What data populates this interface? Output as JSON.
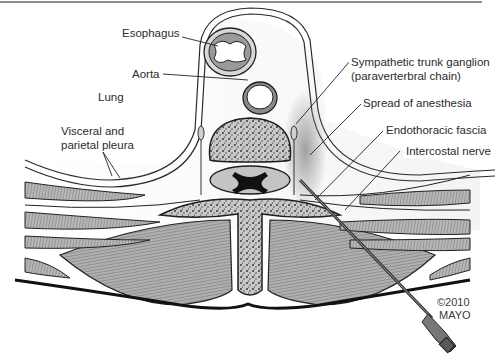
{
  "figure": {
    "labels": {
      "esophagus": "Esophagus",
      "aorta": "Aorta",
      "lung": "Lung",
      "pleura_line1": "Visceral and",
      "pleura_line2": "parietal pleura",
      "ganglion_line1": "Sympathetic trunk ganglion",
      "ganglion_line2": "(paraverterbral chain)",
      "spread": "Spread of anesthesia",
      "fascia": "Endothoracic fascia",
      "nerve": "Intercostal nerve"
    },
    "credit": {
      "year": "©2010",
      "owner": "MAYO"
    },
    "colors": {
      "bone_fill": "#c9c9c9",
      "muscle_fill": "#a9a9a9",
      "outline": "#1e1e1e",
      "shadow": "#9a9a9a"
    }
  }
}
